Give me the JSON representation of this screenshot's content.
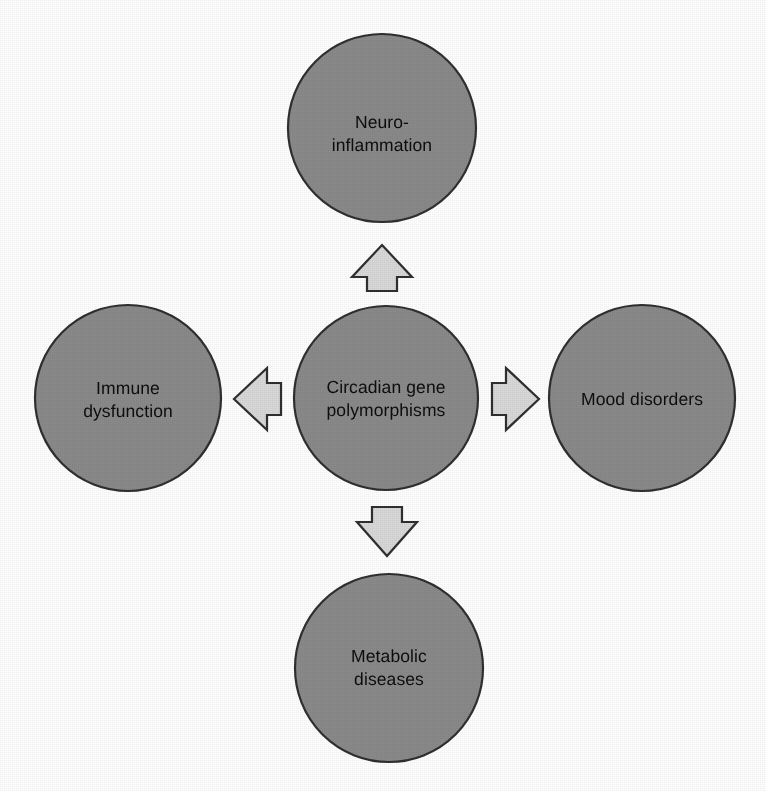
{
  "figure": {
    "type": "concept-map",
    "background_color": "#ffffff",
    "width": 766,
    "height": 791,
    "node_fill": "#8a8a8a",
    "node_stroke": "#2f2f2f",
    "arrow_fill": "#d9d9d9",
    "arrow_stroke": "#2f2f2f",
    "text_color": "#0d0d0d"
  },
  "nodes": [
    {
      "id": "center",
      "role": "source",
      "label": "Circadian gene\npolymorphisms",
      "cx": 386,
      "cy": 398,
      "r": 92
    },
    {
      "id": "top",
      "role": "outcome",
      "label": "Neuro-\ninflammation",
      "cx": 382,
      "cy": 128,
      "r": 94
    },
    {
      "id": "left",
      "role": "outcome",
      "label": "Immune\ndysfunction",
      "cx": 128,
      "cy": 398,
      "r": 93
    },
    {
      "id": "right",
      "role": "outcome",
      "label": "Mood disorders",
      "cx": 642,
      "cy": 398,
      "r": 93
    },
    {
      "id": "bottom",
      "role": "outcome",
      "label": "Metabolic\ndiseases",
      "cx": 389,
      "cy": 668,
      "r": 94
    }
  ],
  "arrows": [
    {
      "id": "arrow-up",
      "direction": "up",
      "from": "center",
      "to": "top"
    },
    {
      "id": "arrow-down",
      "direction": "down",
      "from": "center",
      "to": "bottom"
    },
    {
      "id": "arrow-left",
      "direction": "left",
      "from": "center",
      "to": "left"
    },
    {
      "id": "arrow-right",
      "direction": "right",
      "from": "center",
      "to": "right"
    }
  ]
}
